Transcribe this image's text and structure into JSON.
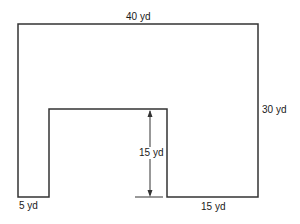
{
  "diagram": {
    "type": "floor-plan-dimension",
    "shape": "U-shaped region (rectangle with rectangular notch cut from bottom)",
    "stroke_color": "#333333",
    "background": "#ffffff",
    "labels": {
      "top_width": "40 yd",
      "right_height": "30 yd",
      "notch_height": "15 yd",
      "bottom_left_width": "5 yd",
      "bottom_right_width": "15 yd"
    },
    "dimensions_yd": {
      "outer_width": 40,
      "outer_height": 30,
      "notch_height": 15,
      "left_leg_width": 5,
      "right_leg_width": 15
    }
  }
}
